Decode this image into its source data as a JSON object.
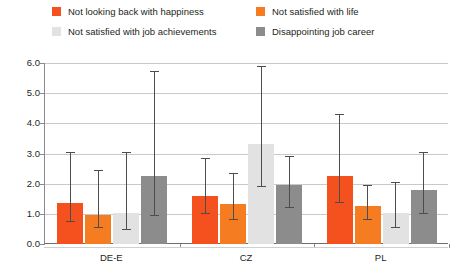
{
  "legend": {
    "entries": [
      {
        "label": "Not looking back with happiness",
        "color": "#f4511e",
        "row": 0,
        "col": 0
      },
      {
        "label": "Not satisfied with life",
        "color": "#f57c20",
        "row": 0,
        "col": 1
      },
      {
        "label": "Not satisfied with job achievements",
        "color": "#e2e2e2",
        "row": 1,
        "col": 0
      },
      {
        "label": "Disappointing job career",
        "color": "#8c8c8c",
        "row": 1,
        "col": 1
      }
    ]
  },
  "axis": {
    "y_ticks": [
      "0.0",
      "1.0",
      "2.0",
      "3.0",
      "4.0",
      "5.0",
      "6.0"
    ],
    "x_categories": [
      "DE-E",
      "CZ",
      "PL"
    ]
  },
  "chart_data": {
    "type": "bar",
    "title": "",
    "xlabel": "",
    "ylabel": "",
    "ylim": [
      0.0,
      6.0
    ],
    "ytick_step": 1.0,
    "grid": true,
    "legend_position": "top",
    "reference_line": 1.0,
    "categories": [
      "DE-E",
      "CZ",
      "PL"
    ],
    "series": [
      {
        "name": "Not looking back with happiness",
        "color": "#f4511e",
        "values": [
          1.35,
          1.6,
          2.25
        ],
        "ci_low": [
          0.72,
          0.98,
          1.35
        ],
        "ci_high": [
          3.05,
          2.85,
          4.3
        ]
      },
      {
        "name": "Not satisfied with life",
        "color": "#f57c20",
        "values": [
          0.95,
          1.32,
          1.25
        ],
        "ci_low": [
          0.52,
          0.78,
          0.78
        ],
        "ci_high": [
          2.45,
          2.35,
          1.95
        ]
      },
      {
        "name": "Not satisfied with job achievements",
        "color": "#e2e2e2",
        "values": [
          1.02,
          3.3,
          1.02
        ],
        "ci_low": [
          0.45,
          1.9,
          0.52
        ],
        "ci_high": [
          3.05,
          5.9,
          2.05
        ]
      },
      {
        "name": "Disappointing job career",
        "color": "#8c8c8c",
        "values": [
          2.25,
          1.95,
          1.8
        ],
        "ci_low": [
          0.92,
          1.18,
          1.0
        ],
        "ci_high": [
          5.75,
          2.92,
          3.05
        ]
      }
    ]
  }
}
